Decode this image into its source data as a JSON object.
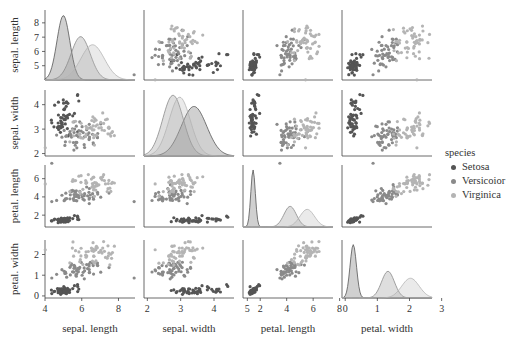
{
  "chart_data": {
    "type": "scatter",
    "title": "",
    "variables": [
      "sepal. length",
      "sepal. width",
      "petal. length",
      "petal. width"
    ],
    "ranges": [
      [
        4,
        8.9
      ],
      [
        1.9,
        4.6
      ],
      [
        0.7,
        7.5
      ],
      [
        -0.1,
        2.7
      ]
    ],
    "ticks": [
      [
        4,
        6,
        8
      ],
      [
        2,
        3,
        4,
        5
      ],
      [
        2,
        4,
        6,
        8
      ],
      [
        0,
        1,
        2,
        3
      ]
    ],
    "ytick_rows": [
      [
        5,
        6,
        7,
        8
      ],
      [
        2,
        3,
        4
      ],
      [
        2,
        4,
        6
      ],
      [
        0,
        1,
        2
      ]
    ],
    "legend": {
      "title": "species",
      "position": "right",
      "entries": [
        "Setosa",
        "Versicolor",
        "Virginica"
      ]
    },
    "colors": {
      "Setosa": "#555555",
      "Versicolor": "#8a8a8a",
      "Virginica": "#b4b4b4"
    },
    "clusters": {
      "Setosa": {
        "mean": [
          5.0,
          3.4,
          1.46,
          0.25
        ],
        "sd": [
          0.35,
          0.38,
          0.17,
          0.1
        ]
      },
      "Versicolor": {
        "mean": [
          5.94,
          2.77,
          4.26,
          1.33
        ],
        "sd": [
          0.52,
          0.31,
          0.47,
          0.2
        ]
      },
      "Virginica": {
        "mean": [
          6.59,
          2.97,
          5.55,
          2.03
        ],
        "sd": [
          0.64,
          0.32,
          0.55,
          0.27
        ]
      }
    },
    "points_per_species": 50,
    "grid": false
  },
  "axis_labels": [
    "sepal. length",
    "sepal. width",
    "petal. length",
    "petal. width"
  ],
  "legend": {
    "title": "species",
    "items": [
      "Setosa",
      "Versicoior",
      "Virginica"
    ]
  }
}
